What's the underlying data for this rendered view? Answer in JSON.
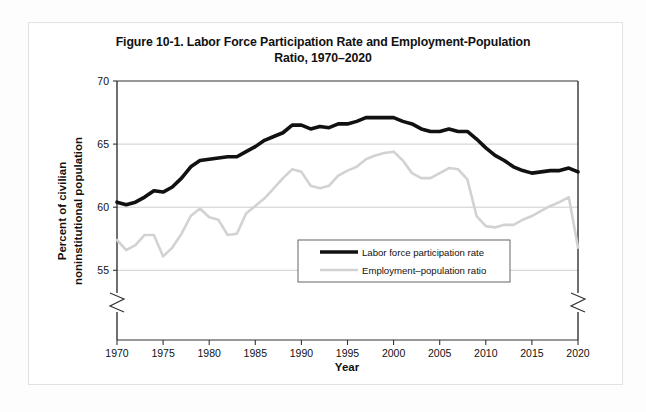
{
  "figure": {
    "title_line1": "Figure 10-1. Labor Force Participation Rate and Employment-Population",
    "title_line2": "Ratio, 1970–2020"
  },
  "axes": {
    "y_axis_title_line1": "Percent of civilian",
    "y_axis_title_line2": "noninstitutional population",
    "x_axis_title": "Year",
    "y_ticks": [
      "55",
      "60",
      "65",
      "70"
    ],
    "x_ticks": [
      "1970",
      "1975",
      "1980",
      "1985",
      "1990",
      "1995",
      "2000",
      "2005",
      "2010",
      "2015",
      "2020"
    ]
  },
  "legend": {
    "items": [
      {
        "label": "Labor force participation rate",
        "color": "#111111",
        "width": 3.6
      },
      {
        "label": "Employment–population ratio",
        "color": "#d2d2d2",
        "width": 2.6
      }
    ]
  },
  "colors": {
    "series1": "#111111",
    "series2": "#d2d2d2",
    "grid": "#b8b8b8",
    "axis": "#333333",
    "frame": "#e2e2e2"
  },
  "chart_data": {
    "type": "line",
    "title": "Figure 10-1. Labor Force Participation Rate and Employment-Population Ratio, 1970–2020",
    "xlabel": "Year",
    "ylabel": "Percent of civilian noninstitutional population",
    "xlim": [
      1970,
      2020
    ],
    "ylim": [
      53.2,
      70
    ],
    "y_axis_break": true,
    "x_axis_break": true,
    "grid": "horizontal",
    "legend_position": "inside-center-bottom",
    "x": [
      1970,
      1971,
      1972,
      1973,
      1974,
      1975,
      1976,
      1977,
      1978,
      1979,
      1980,
      1981,
      1982,
      1983,
      1984,
      1985,
      1986,
      1987,
      1988,
      1989,
      1990,
      1991,
      1992,
      1993,
      1994,
      1995,
      1996,
      1997,
      1998,
      1999,
      2000,
      2001,
      2002,
      2003,
      2004,
      2005,
      2006,
      2007,
      2008,
      2009,
      2010,
      2011,
      2012,
      2013,
      2014,
      2015,
      2016,
      2017,
      2018,
      2019,
      2020
    ],
    "series": [
      {
        "name": "Labor force participation rate",
        "color": "#111111",
        "values": [
          60.4,
          60.2,
          60.4,
          60.8,
          61.3,
          61.2,
          61.6,
          62.3,
          63.2,
          63.7,
          63.8,
          63.9,
          64.0,
          64.0,
          64.4,
          64.8,
          65.3,
          65.6,
          65.9,
          66.5,
          66.5,
          66.2,
          66.4,
          66.3,
          66.6,
          66.6,
          66.8,
          67.1,
          67.1,
          67.1,
          67.1,
          66.8,
          66.6,
          66.2,
          66.0,
          66.0,
          66.2,
          66.0,
          66.0,
          65.4,
          64.7,
          64.1,
          63.7,
          63.2,
          62.9,
          62.7,
          62.8,
          62.9,
          62.9,
          63.1,
          62.8
        ]
      },
      {
        "name": "Employment–population ratio",
        "color": "#d2d2d2",
        "values": [
          57.4,
          56.6,
          57.0,
          57.8,
          57.8,
          56.1,
          56.8,
          57.9,
          59.3,
          59.9,
          59.2,
          59.0,
          57.8,
          57.9,
          59.5,
          60.1,
          60.7,
          61.5,
          62.3,
          63.0,
          62.8,
          61.7,
          61.5,
          61.7,
          62.5,
          62.9,
          63.2,
          63.8,
          64.1,
          64.3,
          64.4,
          63.7,
          62.7,
          62.3,
          62.3,
          62.7,
          63.1,
          63.0,
          62.2,
          59.3,
          58.5,
          58.4,
          58.6,
          58.6,
          59.0,
          59.3,
          59.7,
          60.1,
          60.4,
          60.8,
          56.8
        ]
      }
    ]
  }
}
